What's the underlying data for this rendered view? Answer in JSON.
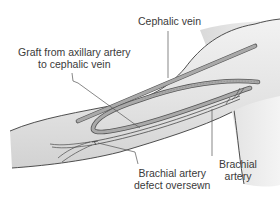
{
  "diagram": {
    "type": "anatomical-illustration",
    "colors": {
      "skin_fill": "#e6e6e6",
      "skin_shadow": "#cfcfcf",
      "outline": "#3c3c3c",
      "vessel_fill": "#a9a9a9",
      "vessel_edge": "#555555",
      "leader_line": "#555555",
      "text": "#3a3a3a",
      "background": "#ffffff"
    },
    "labels": {
      "cephalic_vein": {
        "lines": [
          "Cephalic vein"
        ]
      },
      "graft": {
        "lines": [
          "Graft from axillary artery",
          "to cephalic vein"
        ]
      },
      "brachial_defect": {
        "lines": [
          "Brachial artery",
          "defect oversewn"
        ]
      },
      "brachial_artery": {
        "lines": [
          "Brachial",
          "artery"
        ]
      }
    }
  }
}
